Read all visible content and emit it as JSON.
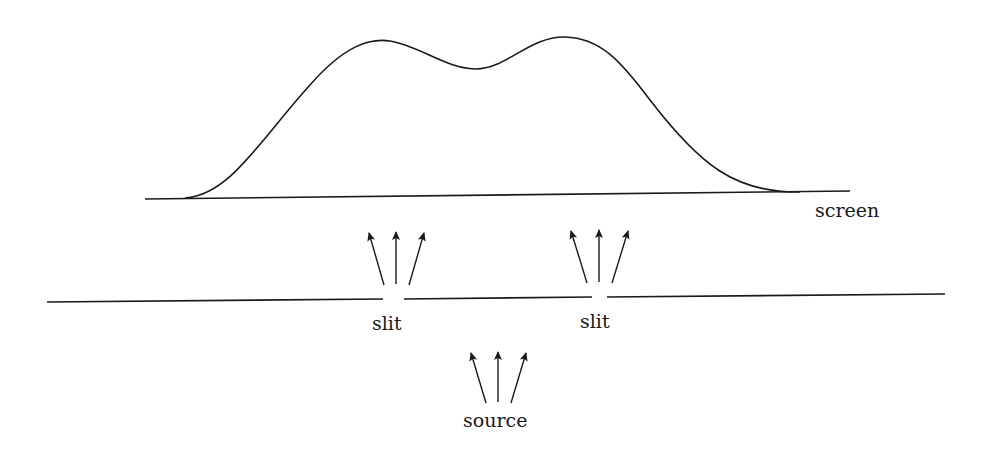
{
  "diagram": {
    "labels": {
      "screen": "screen",
      "slit_left": "slit",
      "slit_right": "slit",
      "source": "source"
    },
    "elements": {
      "screen_line": "screen",
      "barrier_line": "barrier with two slits",
      "intensity_curve": "intensity pattern on screen (two-peaked)",
      "arrow_groups": [
        "source rays",
        "left slit rays",
        "right slit rays"
      ]
    },
    "colors": {
      "stroke": "#1a1a1a",
      "background": "#ffffff"
    }
  }
}
